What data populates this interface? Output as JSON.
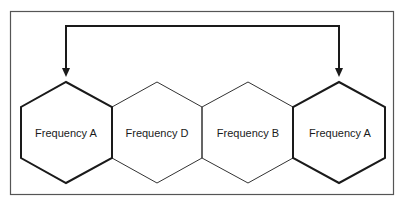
{
  "diagram": {
    "type": "frequency-reuse-hexagon-cells",
    "frame": {
      "stroke": "#555555"
    },
    "colors": {
      "line": "#1a1a1a",
      "thin_line": "#333333",
      "background": "#ffffff"
    },
    "cells": [
      {
        "label": "Frequency A",
        "emphasized": true
      },
      {
        "label": "Frequency D",
        "emphasized": false
      },
      {
        "label": "Frequency B",
        "emphasized": false
      },
      {
        "label": "Frequency A",
        "emphasized": true
      }
    ],
    "connector": {
      "description": "Bracket arrow linking the two Frequency A cells",
      "from_cell": 0,
      "to_cell": 3,
      "arrowheads": "both-ends-pointing-down"
    }
  }
}
